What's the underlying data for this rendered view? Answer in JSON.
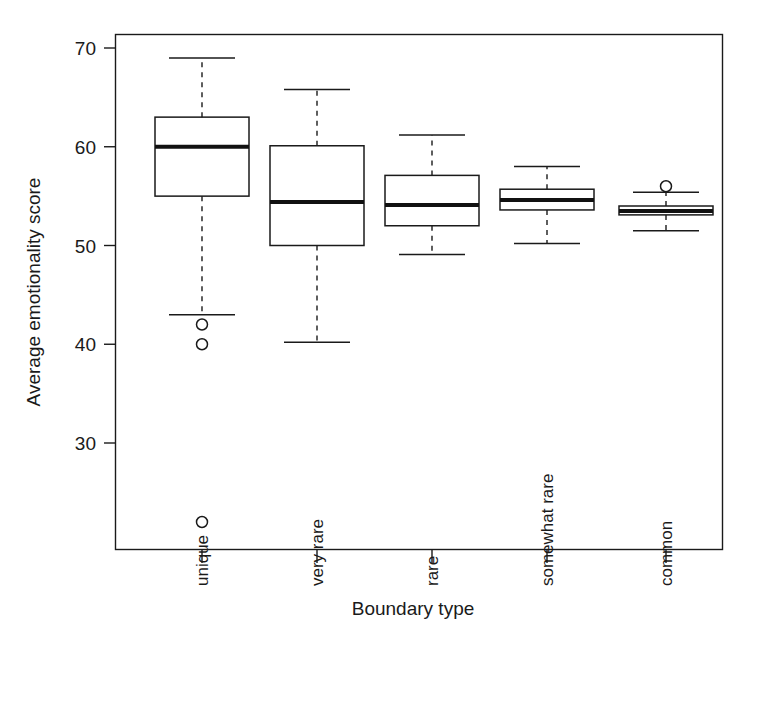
{
  "chart_data": {
    "type": "box",
    "title": "",
    "xlabel": "Boundary type",
    "ylabel": "Average emotionality score",
    "categories": [
      "unique",
      "very rare",
      "rare",
      "somewhat rare",
      "common"
    ],
    "ylim": [
      21,
      70.5
    ],
    "yticks": [
      30,
      40,
      50,
      60,
      70
    ],
    "ytick_labels": [
      "30",
      "40",
      "50",
      "60",
      "70"
    ],
    "grid": false,
    "legend": "none",
    "boxes": [
      {
        "category": "unique",
        "whisker_low": 43.0,
        "q1": 55.0,
        "median": 60.0,
        "q3": 63.0,
        "whisker_high": 69.0,
        "outliers": [
          42.0,
          40.0,
          22.0
        ]
      },
      {
        "category": "very rare",
        "whisker_low": 40.2,
        "q1": 50.0,
        "median": 54.4,
        "q3": 60.1,
        "whisker_high": 65.8,
        "outliers": []
      },
      {
        "category": "rare",
        "whisker_low": 49.1,
        "q1": 52.0,
        "median": 54.1,
        "q3": 57.1,
        "whisker_high": 61.2,
        "outliers": []
      },
      {
        "category": "somewhat rare",
        "whisker_low": 50.2,
        "q1": 53.6,
        "median": 54.6,
        "q3": 55.7,
        "whisker_high": 58.0,
        "outliers": []
      },
      {
        "category": "common",
        "whisker_low": 51.5,
        "q1": 53.1,
        "median": 53.5,
        "q3": 54.0,
        "whisker_high": 55.4,
        "outliers": [
          56.0
        ]
      }
    ]
  },
  "axis": {
    "x_title": "Boundary type",
    "y_title": "Average emotionality score"
  },
  "colors": {
    "line": "#1a1a1a",
    "background": "#ffffff",
    "median": "#111111"
  }
}
